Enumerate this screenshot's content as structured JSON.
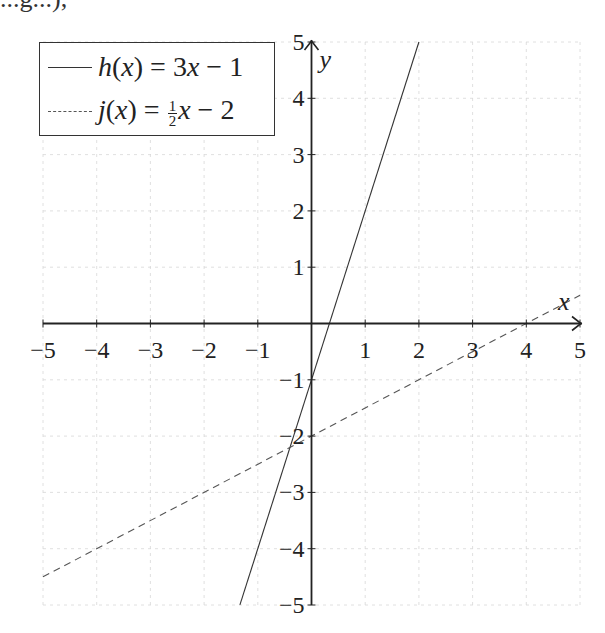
{
  "page": {
    "top_cut_text": "...g...),"
  },
  "chart_data": {
    "type": "line",
    "title": "",
    "xlabel": "x",
    "ylabel": "y",
    "xlim": [
      -5,
      5
    ],
    "ylim": [
      -5,
      5
    ],
    "grid": true,
    "grid_style": "dashed",
    "legend_position": "top-left",
    "x_ticks": [
      -5,
      -4,
      -3,
      -2,
      -1,
      1,
      2,
      3,
      4,
      5
    ],
    "x_tick_labels": [
      "−5",
      "−4",
      "−3",
      "−2",
      "−1",
      "1",
      "2",
      "3",
      "4",
      "5"
    ],
    "y_ticks": [
      -5,
      -4,
      -3,
      -2,
      -1,
      1,
      2,
      3,
      4,
      5
    ],
    "y_tick_labels": [
      "−5",
      "−4",
      "−3",
      "−2",
      "−1",
      "1",
      "2",
      "3",
      "4",
      "5"
    ],
    "series": [
      {
        "name": "h(x) = 3x − 1",
        "legend": {
          "fn": "h",
          "var": "x",
          "rhs_coef": "3",
          "rhs_const": "1"
        },
        "slope": 3,
        "intercept": -1,
        "style": "solid",
        "color": "#333333",
        "x_range": [
          -1.333,
          2
        ]
      },
      {
        "name": "j(x) = ½x − 2",
        "legend": {
          "fn": "j",
          "var": "x",
          "frac_num": "1",
          "frac_den": "2",
          "rhs_const": "2"
        },
        "slope": 0.5,
        "intercept": -2,
        "style": "dashed",
        "color": "#555555",
        "x_range": [
          -5,
          5
        ]
      }
    ]
  }
}
